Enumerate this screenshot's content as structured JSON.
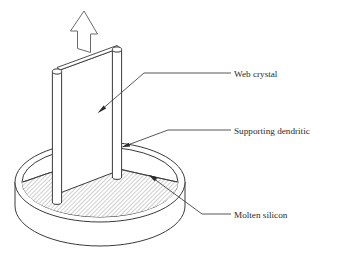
{
  "figure": {
    "background_color": "#ffffff",
    "line_color": "#3a3a3a",
    "hatch_color": "#8d8d8d",
    "text_color": "#2b2b2b",
    "width": 343,
    "height": 279
  },
  "labels": [
    {
      "id": "web-crystal",
      "text": "Web crystal",
      "text_x": 234,
      "text_y": 76,
      "dash_x1": 223,
      "dash_x2": 231,
      "dash_y": 73
    },
    {
      "id": "supporting-dendritic",
      "text": "Supporting dendritic",
      "text_x": 234,
      "text_y": 133,
      "dash_x1": 223,
      "dash_x2": 231,
      "dash_y": 130
    },
    {
      "id": "molten-silicon",
      "text": "Molten silicon",
      "text_x": 234,
      "text_y": 221,
      "dash_x1": 223,
      "dash_x2": 231,
      "dash_y": 218
    }
  ],
  "leaders": [
    {
      "id": "leader-web-crystal",
      "points": "223,73 144,73 98,113",
      "arrow_tip": "98,113",
      "arrow_angle": 221
    },
    {
      "id": "leader-supporting-dendritic",
      "points": "223,130 168,130 122,147",
      "arrow_tip": "122,147",
      "arrow_angle": 200
    },
    {
      "id": "leader-molten-silicon",
      "points": "223,214 202,214 149,175",
      "arrow_tip": "149,175",
      "arrow_angle": 216
    }
  ],
  "pull_arrow": {
    "id": "pull-direction-arrow",
    "description": "hollow outlined arrow indicating upward pull direction",
    "outline_points": "84,11 97,34 90,34 90,52 77,48 77,31 70,31"
  },
  "crucible": {
    "id": "crucible",
    "outer_rim_center_x": 100,
    "outer_rim_center_y": 182,
    "outer_rim_rx": 85,
    "outer_rim_ry": 40,
    "inner_rim_rx": 78,
    "inner_rim_ry": 35,
    "wall_depth": 44
  },
  "melt": {
    "id": "molten-silicon-surface",
    "hatch_angle_deg": 45,
    "hatch_spacing": 3,
    "meniscus_description": "concave dip in the melt surface where the web ribbon emerges"
  },
  "web_crystal": {
    "id": "web-ribbon",
    "description": "thin flat silicon ribbon drawn vertically out of the melt"
  },
  "dendrites": [
    {
      "id": "left-dendrite",
      "description": "cylindrical supporting dendrite at left edge of web",
      "top_x": 57,
      "top_y": 70,
      "bottom_y": 205
    },
    {
      "id": "right-dendrite",
      "description": "cylindrical supporting dendrite at right edge of web",
      "top_x": 117,
      "top_y": 48,
      "bottom_y": 180
    }
  ]
}
